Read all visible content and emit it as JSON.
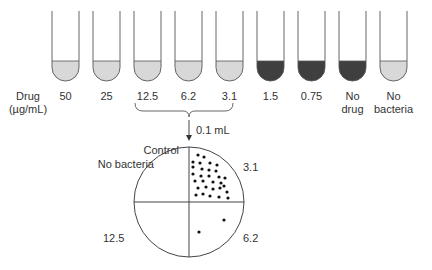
{
  "colors": {
    "clear_fill": "#d8d8d8",
    "turbid_fill": "#3f3f3f",
    "stroke": "#555555",
    "background": "#ffffff"
  },
  "row_label": {
    "line1": "Drug",
    "line2": "(µg/mL)"
  },
  "tubes": [
    {
      "label1": "50",
      "label2": "",
      "state": "clear"
    },
    {
      "label1": "25",
      "label2": "",
      "state": "clear"
    },
    {
      "label1": "12.5",
      "label2": "",
      "state": "clear"
    },
    {
      "label1": "6.2",
      "label2": "",
      "state": "clear"
    },
    {
      "label1": "3.1",
      "label2": "",
      "state": "clear"
    },
    {
      "label1": "1.5",
      "label2": "",
      "state": "turbid"
    },
    {
      "label1": "0.75",
      "label2": "",
      "state": "turbid"
    },
    {
      "label1": "No",
      "label2": "drug",
      "state": "turbid"
    },
    {
      "label1": "No",
      "label2": "bacteria",
      "state": "clear"
    }
  ],
  "transfer": {
    "volume": "0.1 mL"
  },
  "plate": {
    "control_label1": "Control",
    "control_label2": "No bacteria",
    "q_top_right": "3.1",
    "q_bottom_left": "12.5",
    "q_bottom_right": "6.2"
  }
}
